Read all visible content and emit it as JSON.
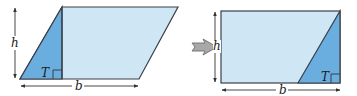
{
  "colors": {
    "light_fill": "#cfe6f5",
    "dark_fill": "#6aaee0",
    "outline": "#3a3f47",
    "dim_line": "#333333",
    "transform_arrow_fill": "#a8a8a8",
    "transform_arrow_stroke": "#6e6e6e"
  },
  "left_figure": {
    "shape": "parallelogram",
    "height_label": "h",
    "base_label": "b",
    "triangle_label": "T"
  },
  "transform_arrow": {
    "direction": "right"
  },
  "right_figure": {
    "shape": "rectangle",
    "height_label": "h",
    "base_label": "b",
    "triangle_label": "T"
  }
}
